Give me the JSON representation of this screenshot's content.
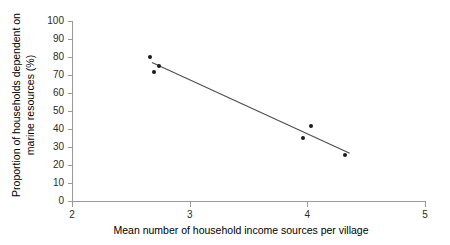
{
  "chart_data": {
    "type": "scatter",
    "title": "",
    "xlabel": "Mean number of household income sources per village",
    "ylabel_line1": "Proportion of households dependent on",
    "ylabel_line2": "marine resources (%)",
    "xlim": [
      2,
      5
    ],
    "ylim": [
      0,
      100
    ],
    "xticks": [
      2,
      3,
      4,
      5
    ],
    "xtick_labels": [
      "2",
      "3",
      "4",
      "5"
    ],
    "yticks": [
      0,
      10,
      20,
      30,
      40,
      50,
      60,
      70,
      80,
      90,
      100
    ],
    "ytick_labels": [
      "0",
      "10",
      "20",
      "30",
      "40",
      "50",
      "60",
      "70",
      "80",
      "90",
      "100"
    ],
    "grid": false,
    "legend": false,
    "marker_color": "#1a1a1a",
    "line_color": "#4d4d4d",
    "axis_color": "#9a9a9a",
    "points": [
      {
        "x": 2.66,
        "y": 80.0
      },
      {
        "x": 2.74,
        "y": 75.0
      },
      {
        "x": 2.7,
        "y": 71.8
      },
      {
        "x": 4.03,
        "y": 41.5
      },
      {
        "x": 3.96,
        "y": 34.8
      },
      {
        "x": 4.32,
        "y": 25.3
      }
    ],
    "trendline": {
      "type": "linear-fit",
      "x_start": 2.68,
      "y_start": 77.0,
      "x_end": 4.36,
      "y_end": 26.5
    }
  }
}
